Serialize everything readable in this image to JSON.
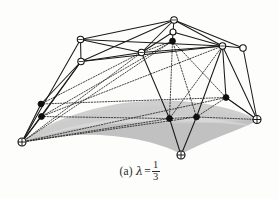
{
  "figure": {
    "kind": "3d-polyhedral-surface-diagram",
    "background_color": "#fdfdfc",
    "ink_color": "#1f1f1f",
    "surface_fill_color": "#c9c9c9",
    "surface_shadow_color": "#b0b0b0",
    "caption": {
      "label": "(a)",
      "symbol": "λ",
      "equals": "=",
      "value_numerator": "1",
      "value_denominator": "3",
      "full_text": "(a) λ = 1/3"
    },
    "vertices": [
      {
        "id": "apex",
        "marker": "open-circle",
        "x": 174.0,
        "y": 20.0
      },
      {
        "id": "apex-inner",
        "marker": "open-circle",
        "x": 173.0,
        "y": 32.0
      },
      {
        "id": "apex-dot",
        "marker": "filled-dot",
        "x": 172.5,
        "y": 41.0
      },
      {
        "id": "upper-left-a",
        "marker": "open-circle",
        "x": 80.5,
        "y": 39.5
      },
      {
        "id": "upper-left-b",
        "marker": "open-circle",
        "x": 81.0,
        "y": 61.5
      },
      {
        "id": "mid-left",
        "marker": "open-circle",
        "x": 141.5,
        "y": 52.5
      },
      {
        "id": "upper-right-a",
        "marker": "open-circle",
        "x": 222.5,
        "y": 46.0
      },
      {
        "id": "upper-right-b",
        "marker": "open-circle",
        "x": 243.0,
        "y": 48.0
      },
      {
        "id": "dot-left-up",
        "marker": "filled-dot",
        "x": 41.0,
        "y": 104.0
      },
      {
        "id": "dot-left-lo",
        "marker": "filled-dot",
        "x": 41.5,
        "y": 116.5
      },
      {
        "id": "dot-right",
        "marker": "filled-dot",
        "x": 226.0,
        "y": 97.5
      },
      {
        "id": "dot-bot-mid",
        "marker": "filled-dot",
        "x": 169.5,
        "y": 118.5
      },
      {
        "id": "dot-bot-rgt",
        "marker": "filled-dot",
        "x": 196.5,
        "y": 117.0
      },
      {
        "id": "corner-left",
        "marker": "circled-cross",
        "x": 22.0,
        "y": 142.0
      },
      {
        "id": "corner-bot",
        "marker": "circled-cross",
        "x": 181.0,
        "y": 155.0
      },
      {
        "id": "corner-right",
        "marker": "circled-cross",
        "x": 257.0,
        "y": 119.5
      }
    ],
    "solid_edges": [
      [
        "apex",
        "upper-left-a"
      ],
      [
        "apex",
        "upper-left-b"
      ],
      [
        "apex",
        "mid-left"
      ],
      [
        "apex",
        "upper-right-a"
      ],
      [
        "apex",
        "upper-right-b"
      ],
      [
        "apex",
        "apex-inner"
      ],
      [
        "apex-inner",
        "mid-left"
      ],
      [
        "apex-inner",
        "upper-right-a"
      ],
      [
        "upper-left-a",
        "upper-left-b"
      ],
      [
        "upper-left-a",
        "mid-left"
      ],
      [
        "upper-left-a",
        "upper-right-a"
      ],
      [
        "upper-left-b",
        "mid-left"
      ],
      [
        "upper-left-b",
        "upper-right-a"
      ],
      [
        "upper-right-a",
        "upper-right-b"
      ],
      [
        "upper-left-a",
        "corner-left"
      ],
      [
        "upper-left-b",
        "corner-left"
      ],
      [
        "upper-left-b",
        "dot-left-up"
      ],
      [
        "upper-left-b",
        "dot-left-lo"
      ],
      [
        "upper-right-b",
        "corner-right"
      ],
      [
        "upper-right-a",
        "corner-right"
      ],
      [
        "apex-dot",
        "dot-bot-mid"
      ],
      [
        "apex-dot",
        "dot-bot-rgt"
      ],
      [
        "apex-dot",
        "dot-right"
      ],
      [
        "apex-dot",
        "corner-bot"
      ],
      [
        "dot-bot-mid",
        "corner-bot"
      ],
      [
        "dot-bot-rgt",
        "corner-bot"
      ],
      [
        "dot-right",
        "corner-right"
      ],
      [
        "dot-left-up",
        "corner-left"
      ],
      [
        "dot-left-lo",
        "corner-left"
      ],
      [
        "mid-left",
        "dot-bot-mid"
      ]
    ],
    "dotted_edges": [
      [
        "corner-left",
        "dot-right"
      ],
      [
        "corner-left",
        "dot-bot-rgt"
      ],
      [
        "corner-left",
        "dot-bot-mid"
      ],
      [
        "corner-left",
        "mid-left"
      ],
      [
        "dot-left-up",
        "mid-left"
      ],
      [
        "dot-left-lo",
        "dot-bot-mid"
      ],
      [
        "dot-bot-mid",
        "dot-bot-rgt"
      ],
      [
        "dot-bot-rgt",
        "dot-right"
      ],
      [
        "dot-right",
        "corner-right"
      ],
      [
        "dot-bot-rgt",
        "corner-right"
      ],
      [
        "mid-left",
        "apex-dot"
      ],
      [
        "apex-dot",
        "corner-left"
      ],
      [
        "apex-dot",
        "dot-left-lo"
      ],
      [
        "upper-right-a",
        "dot-bot-mid"
      ],
      [
        "upper-right-a",
        "dot-left-lo"
      ]
    ]
  }
}
